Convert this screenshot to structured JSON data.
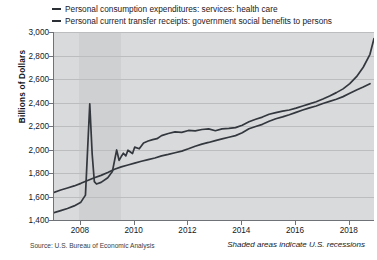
{
  "legend": {
    "items": [
      {
        "label": "Personal consumption expenditures: services: health care",
        "color": "#33373e",
        "marker": "line-swatch"
      },
      {
        "label": "Personal current transfer receipts: government social benefits to persons",
        "color": "#33373e",
        "marker": "line-swatch"
      }
    ]
  },
  "axes": {
    "y_title": "Billions of Dollars",
    "y_ticks": [
      "1,400",
      "1,600",
      "1,800",
      "2,000",
      "2,200",
      "2,400",
      "2,600",
      "2,800",
      "3,000"
    ],
    "x_ticks": [
      "2008",
      "2010",
      "2012",
      "2014",
      "2016",
      "2018"
    ]
  },
  "footer": {
    "source": "Source: U.S. Bureau of Economic Analysis",
    "note": "Shaded areas indicate U.S. recessions"
  },
  "chart_data": {
    "type": "line",
    "title": "",
    "xlabel": "",
    "ylabel": "Billions of Dollars",
    "xlim": [
      2007.0,
      2018.9
    ],
    "ylim": [
      1400,
      3000
    ],
    "ytick_values": [
      1400,
      1600,
      1800,
      2000,
      2200,
      2400,
      2600,
      2800,
      3000
    ],
    "xtick_values": [
      2008,
      2010,
      2012,
      2014,
      2016,
      2018
    ],
    "grid": true,
    "legend_position": "top-left",
    "shaded_regions": [
      {
        "label": "U.S. recession",
        "x_start": 2007.92,
        "x_end": 2009.5,
        "color": "#cfd0d1"
      }
    ],
    "series": [
      {
        "name": "Personal consumption expenditures: services: health care",
        "color": "#33373e",
        "points": [
          [
            2007.0,
            1635
          ],
          [
            2007.25,
            1655
          ],
          [
            2007.5,
            1672
          ],
          [
            2007.75,
            1690
          ],
          [
            2008.0,
            1712
          ],
          [
            2008.25,
            1736
          ],
          [
            2008.5,
            1760
          ],
          [
            2008.75,
            1780
          ],
          [
            2009.0,
            1805
          ],
          [
            2009.25,
            1832
          ],
          [
            2009.5,
            1852
          ],
          [
            2009.75,
            1868
          ],
          [
            2010.0,
            1884
          ],
          [
            2010.25,
            1900
          ],
          [
            2010.5,
            1914
          ],
          [
            2010.75,
            1928
          ],
          [
            2011.0,
            1946
          ],
          [
            2011.25,
            1958
          ],
          [
            2011.5,
            1972
          ],
          [
            2011.75,
            1986
          ],
          [
            2012.0,
            2006
          ],
          [
            2012.25,
            2028
          ],
          [
            2012.5,
            2046
          ],
          [
            2012.75,
            2060
          ],
          [
            2013.0,
            2076
          ],
          [
            2013.25,
            2090
          ],
          [
            2013.5,
            2104
          ],
          [
            2013.75,
            2118
          ],
          [
            2014.0,
            2142
          ],
          [
            2014.25,
            2176
          ],
          [
            2014.5,
            2196
          ],
          [
            2014.75,
            2214
          ],
          [
            2015.0,
            2240
          ],
          [
            2015.25,
            2262
          ],
          [
            2015.5,
            2278
          ],
          [
            2015.75,
            2296
          ],
          [
            2016.0,
            2316
          ],
          [
            2016.25,
            2336
          ],
          [
            2016.5,
            2354
          ],
          [
            2016.75,
            2370
          ],
          [
            2017.0,
            2392
          ],
          [
            2017.25,
            2410
          ],
          [
            2017.5,
            2428
          ],
          [
            2017.75,
            2450
          ],
          [
            2018.0,
            2478
          ],
          [
            2018.25,
            2506
          ],
          [
            2018.5,
            2532
          ],
          [
            2018.75,
            2560
          ]
        ],
        "note": "lower curve in chart, rising steadily from ~1,630 to ~2,560"
      },
      {
        "name": "Personal current transfer receipts: government social benefits to persons",
        "color": "#33373e",
        "points": [
          [
            2007.0,
            1462
          ],
          [
            2007.25,
            1480
          ],
          [
            2007.5,
            1498
          ],
          [
            2007.75,
            1520
          ],
          [
            2008.0,
            1552
          ],
          [
            2008.17,
            1612
          ],
          [
            2008.33,
            2388
          ],
          [
            2008.42,
            1960
          ],
          [
            2008.5,
            1726
          ],
          [
            2008.58,
            1706
          ],
          [
            2008.75,
            1720
          ],
          [
            2009.0,
            1760
          ],
          [
            2009.17,
            1812
          ],
          [
            2009.33,
            1996
          ],
          [
            2009.42,
            1908
          ],
          [
            2009.5,
            1940
          ],
          [
            2009.58,
            1968
          ],
          [
            2009.67,
            1946
          ],
          [
            2009.75,
            1994
          ],
          [
            2009.92,
            1966
          ],
          [
            2010.0,
            2020
          ],
          [
            2010.17,
            2006
          ],
          [
            2010.33,
            2056
          ],
          [
            2010.5,
            2072
          ],
          [
            2010.67,
            2084
          ],
          [
            2010.83,
            2092
          ],
          [
            2011.0,
            2118
          ],
          [
            2011.25,
            2136
          ],
          [
            2011.5,
            2150
          ],
          [
            2011.75,
            2146
          ],
          [
            2012.0,
            2162
          ],
          [
            2012.25,
            2158
          ],
          [
            2012.5,
            2170
          ],
          [
            2012.75,
            2176
          ],
          [
            2013.0,
            2160
          ],
          [
            2013.25,
            2176
          ],
          [
            2013.5,
            2180
          ],
          [
            2013.75,
            2186
          ],
          [
            2014.0,
            2206
          ],
          [
            2014.25,
            2236
          ],
          [
            2014.5,
            2258
          ],
          [
            2014.75,
            2276
          ],
          [
            2015.0,
            2300
          ],
          [
            2015.25,
            2314
          ],
          [
            2015.5,
            2326
          ],
          [
            2015.75,
            2336
          ],
          [
            2016.0,
            2352
          ],
          [
            2016.25,
            2370
          ],
          [
            2016.5,
            2388
          ],
          [
            2016.75,
            2406
          ],
          [
            2017.0,
            2430
          ],
          [
            2017.25,
            2456
          ],
          [
            2017.5,
            2484
          ],
          [
            2017.75,
            2516
          ],
          [
            2018.0,
            2560
          ],
          [
            2018.25,
            2620
          ],
          [
            2018.5,
            2700
          ],
          [
            2018.75,
            2810
          ],
          [
            2018.9,
            2944
          ]
        ],
        "note": "upper curve in chart; sharp 2008 stimulus spike to ~2,390 then settles"
      }
    ]
  }
}
